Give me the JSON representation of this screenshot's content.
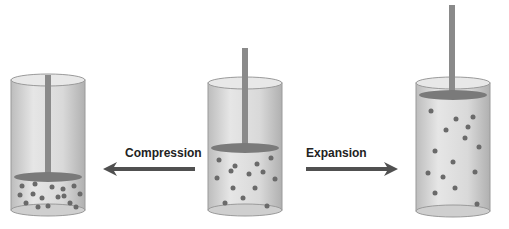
{
  "diagram": {
    "labels": {
      "compression": "Compression",
      "expansion": "Expansion"
    },
    "colors": {
      "arrow": "#505050",
      "glass": "#d4d4d4",
      "glass_edge": "#9a9a9a",
      "rod": "#8a8a8a",
      "piston": "#7a7a7a",
      "molecule": "#6a6a6a"
    },
    "cylinders": [
      {
        "id": "compressed",
        "piston_level": "low",
        "molecule_count": 16
      },
      {
        "id": "initial",
        "piston_level": "middle",
        "molecule_count": 14
      },
      {
        "id": "expanded",
        "piston_level": "high",
        "molecule_count": 15
      }
    ]
  }
}
